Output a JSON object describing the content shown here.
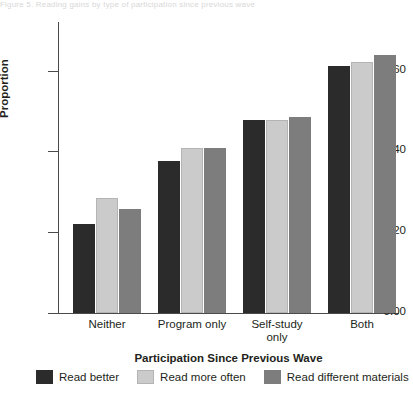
{
  "figure": {
    "top_ghost_text": "Figure 5.  Reading gains by type of participation since previous wave"
  },
  "chart_data": {
    "type": "bar",
    "title": "",
    "xlabel": "Participation Since Previous Wave",
    "ylabel": "Proportion",
    "categories": [
      "Neither",
      "Program only",
      "Self-study only",
      "Both"
    ],
    "category_lines": [
      [
        "Neither"
      ],
      [
        "Program only"
      ],
      [
        "Self-study",
        "only"
      ],
      [
        "Both"
      ]
    ],
    "series": [
      {
        "name": "Read better",
        "color": "#2b2b2b",
        "values": [
          0.22,
          0.375,
          0.478,
          0.61
        ]
      },
      {
        "name": "Read more often",
        "color": "#cbcbcb",
        "values": [
          0.285,
          0.408,
          0.478,
          0.622
        ]
      },
      {
        "name": "Read different materials",
        "color": "#7d7d7d",
        "values": [
          0.258,
          0.408,
          0.486,
          0.638
        ]
      }
    ],
    "ylim": [
      0.0,
      0.72
    ],
    "yticks": [
      0.0,
      0.2,
      0.4,
      0.6
    ],
    "ytick_labels": [
      "0.00",
      "0.20",
      "0.40",
      "0.60"
    ],
    "grid": false,
    "legend_position": "bottom"
  }
}
